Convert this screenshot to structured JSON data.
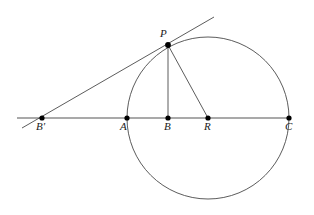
{
  "figure": {
    "width": 314,
    "height": 215,
    "background_color": "#ffffff",
    "stroke_color": "#4a4a4a",
    "point_color": "#000000",
    "label_color": "#1a1a1a"
  },
  "labels": {
    "b_prime": "B'",
    "a": "A",
    "b": "B",
    "r": "R",
    "c": "C",
    "p": "P"
  },
  "geometry": {
    "circle": {
      "cx": 208,
      "cy": 118,
      "r": 81
    },
    "points": [
      {
        "name": "B'",
        "x": 42,
        "y": 118
      },
      {
        "name": "A",
        "x": 127,
        "y": 118
      },
      {
        "name": "B",
        "x": 168,
        "y": 118
      },
      {
        "name": "R",
        "x": 208,
        "y": 118
      },
      {
        "name": "C",
        "x": 289,
        "y": 118
      },
      {
        "name": "P",
        "x": 168,
        "y": 45
      }
    ],
    "segments": [
      {
        "name": "baseline",
        "x1": 17,
        "y1": 118,
        "x2": 291,
        "y2": 118
      },
      {
        "name": "tangent",
        "x1": 22,
        "y1": 128,
        "x2": 214,
        "y2": 17
      },
      {
        "name": "pb",
        "x1": 168,
        "y1": 45,
        "x2": 168,
        "y2": 118
      },
      {
        "name": "pr",
        "x1": 168,
        "y1": 45,
        "x2": 208,
        "y2": 118
      }
    ],
    "label_positions": [
      {
        "name": "B'",
        "x": 37,
        "y": 121
      },
      {
        "name": "A",
        "x": 120,
        "y": 121
      },
      {
        "name": "B",
        "x": 163,
        "y": 121
      },
      {
        "name": "R",
        "x": 203,
        "y": 121
      },
      {
        "name": "C",
        "x": 284,
        "y": 121
      },
      {
        "name": "P",
        "x": 160,
        "y": 28
      }
    ]
  }
}
